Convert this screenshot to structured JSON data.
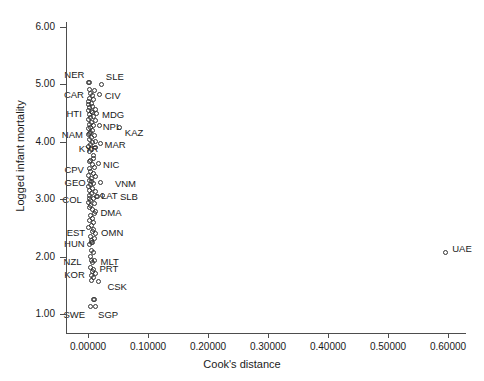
{
  "chart_data": {
    "type": "scatter",
    "title": "",
    "xlabel": "Cook's distance",
    "ylabel": "Logged infant mortality",
    "xlim": [
      -0.02,
      0.63
    ],
    "ylim": [
      0.75,
      6.3
    ],
    "xticks": [
      "0.00000",
      "0.10000",
      "0.20000",
      "0.30000",
      "0.40000",
      "0.50000",
      "0.60000"
    ],
    "xtick_values": [
      0.0,
      0.1,
      0.2,
      0.3,
      0.4,
      0.5,
      0.6
    ],
    "yticks": [
      "1.00",
      "2.00",
      "3.00",
      "4.00",
      "5.00",
      "6.00"
    ],
    "ytick_values": [
      1,
      2,
      3,
      4,
      5,
      6
    ],
    "grid": false,
    "legend": "none",
    "marker": "open-circle",
    "points": [
      {
        "label": "NER",
        "x": 0.0038,
        "y": 5.03,
        "lx": -26,
        "ly": -11
      },
      {
        "label": "SLE",
        "x": 0.023,
        "y": 4.995,
        "lx": 4,
        "ly": -11
      },
      {
        "label": "CAR",
        "x": 0.0048,
        "y": 4.835,
        "lx": -27,
        "ly": -2
      },
      {
        "label": "CIV",
        "x": 0.0195,
        "y": 4.82,
        "lx": 5,
        "ly": -2
      },
      {
        "label": "HTI",
        "x": 0.0075,
        "y": 4.5,
        "lx": -26,
        "ly": -2
      },
      {
        "label": "MDG",
        "x": 0.015,
        "y": 4.49,
        "lx": 5,
        "ly": -2
      },
      {
        "label": "NPL",
        "x": 0.0195,
        "y": 4.28,
        "lx": 3,
        "ly": -2
      },
      {
        "label": "KAZ",
        "x": 0.053,
        "y": 4.235,
        "lx": 5,
        "ly": 2
      },
      {
        "label": "NAM",
        "x": 0.003,
        "y": 4.13,
        "lx": -28,
        "ly": -2
      },
      {
        "label": "MAR",
        "x": 0.021,
        "y": 3.965,
        "lx": 4,
        "ly": -2
      },
      {
        "label": "KYR",
        "x": 0.0095,
        "y": 3.76,
        "lx": -15,
        "ly": -10
      },
      {
        "label": "NIC",
        "x": 0.0185,
        "y": 3.62,
        "lx": 4,
        "ly": -2
      },
      {
        "label": "CPV",
        "x": 0.004,
        "y": 3.53,
        "lx": -26,
        "ly": -2
      },
      {
        "label": "GEO",
        "x": 0.006,
        "y": 3.3,
        "lx": -27,
        "ly": -2
      },
      {
        "label": "VNM",
        "x": 0.0215,
        "y": 3.28,
        "lx": 14,
        "ly": -2
      },
      {
        "label": "LAT",
        "x": 0.0165,
        "y": 3.04,
        "lx": 3,
        "ly": 0
      },
      {
        "label": "SLB",
        "x": 0.025,
        "y": 3.06,
        "lx": 17,
        "ly": -2
      },
      {
        "label": "COL",
        "x": 0.0038,
        "y": 3.01,
        "lx": -28,
        "ly": -2
      },
      {
        "label": "DMA",
        "x": 0.014,
        "y": 2.77,
        "lx": 4,
        "ly": -2
      },
      {
        "label": "EST",
        "x": 0.0078,
        "y": 2.43,
        "lx": -26,
        "ly": -2
      },
      {
        "label": "OMN",
        "x": 0.0135,
        "y": 2.39,
        "lx": 5,
        "ly": 0
      },
      {
        "label": "HUN",
        "x": 0.0068,
        "y": 2.245,
        "lx": -28,
        "ly": -2
      },
      {
        "label": "NZL",
        "x": 0.006,
        "y": 1.93,
        "lx": -28,
        "ly": -2
      },
      {
        "label": "MLT",
        "x": 0.011,
        "y": 1.93,
        "lx": 6,
        "ly": -2
      },
      {
        "label": "KOR",
        "x": 0.007,
        "y": 1.66,
        "lx": -28,
        "ly": 0
      },
      {
        "label": "PRT",
        "x": 0.0125,
        "y": 1.69,
        "lx": 4,
        "ly": -8
      },
      {
        "label": "CSK",
        "x": 0.019,
        "y": 1.56,
        "lx": 8,
        "ly": 2
      },
      {
        "label": "SWE",
        "x": 0.0042,
        "y": 1.12,
        "lx": -27,
        "ly": 5
      },
      {
        "label": "SGP",
        "x": 0.0135,
        "y": 1.12,
        "lx": 2,
        "ly": 5
      },
      {
        "label": "UAE",
        "x": 0.597,
        "y": 2.07,
        "lx": 6,
        "ly": -7
      }
    ],
    "unlabeled_points": [
      {
        "x": 0.001,
        "y": 5.02
      },
      {
        "x": 0.0028,
        "y": 4.9
      },
      {
        "x": 0.0115,
        "y": 4.88
      },
      {
        "x": 0.0085,
        "y": 4.79
      },
      {
        "x": 0.004,
        "y": 4.745
      },
      {
        "x": 0.0105,
        "y": 4.72
      },
      {
        "x": 0.0018,
        "y": 4.7
      },
      {
        "x": 0.006,
        "y": 4.665
      },
      {
        "x": 0.0022,
        "y": 4.64
      },
      {
        "x": 0.009,
        "y": 4.61
      },
      {
        "x": 0.0038,
        "y": 4.585
      },
      {
        "x": 0.0125,
        "y": 4.56
      },
      {
        "x": 0.0015,
        "y": 4.54
      },
      {
        "x": 0.0072,
        "y": 4.52
      },
      {
        "x": 0.003,
        "y": 4.47
      },
      {
        "x": 0.0098,
        "y": 4.44
      },
      {
        "x": 0.0045,
        "y": 4.41
      },
      {
        "x": 0.002,
        "y": 4.38
      },
      {
        "x": 0.0135,
        "y": 4.355
      },
      {
        "x": 0.0062,
        "y": 4.33
      },
      {
        "x": 0.0028,
        "y": 4.3
      },
      {
        "x": 0.0105,
        "y": 4.27
      },
      {
        "x": 0.0042,
        "y": 4.24
      },
      {
        "x": 0.0015,
        "y": 4.215
      },
      {
        "x": 0.0082,
        "y": 4.19
      },
      {
        "x": 0.005,
        "y": 4.16
      },
      {
        "x": 0.0022,
        "y": 4.12
      },
      {
        "x": 0.0118,
        "y": 4.095
      },
      {
        "x": 0.0065,
        "y": 4.06
      },
      {
        "x": 0.0032,
        "y": 4.03
      },
      {
        "x": 0.014,
        "y": 4.005
      },
      {
        "x": 0.0088,
        "y": 3.975
      },
      {
        "x": 0.0048,
        "y": 3.945
      },
      {
        "x": 0.0018,
        "y": 3.915
      },
      {
        "x": 0.0128,
        "y": 3.89
      },
      {
        "x": 0.007,
        "y": 3.86
      },
      {
        "x": 0.0035,
        "y": 3.83
      },
      {
        "x": 0.01,
        "y": 3.7
      },
      {
        "x": 0.0052,
        "y": 3.67
      },
      {
        "x": 0.0025,
        "y": 3.64
      },
      {
        "x": 0.0078,
        "y": 3.6
      },
      {
        "x": 0.0115,
        "y": 3.54
      },
      {
        "x": 0.0045,
        "y": 3.47
      },
      {
        "x": 0.0092,
        "y": 3.44
      },
      {
        "x": 0.002,
        "y": 3.41
      },
      {
        "x": 0.014,
        "y": 3.38
      },
      {
        "x": 0.006,
        "y": 3.35
      },
      {
        "x": 0.003,
        "y": 3.32
      },
      {
        "x": 0.0108,
        "y": 3.27
      },
      {
        "x": 0.0048,
        "y": 3.24
      },
      {
        "x": 0.0018,
        "y": 3.21
      },
      {
        "x": 0.0085,
        "y": 3.18
      },
      {
        "x": 0.0038,
        "y": 3.15
      },
      {
        "x": 0.0125,
        "y": 3.12
      },
      {
        "x": 0.0068,
        "y": 3.09
      },
      {
        "x": 0.0028,
        "y": 3.06
      },
      {
        "x": 0.015,
        "y": 3.04
      },
      {
        "x": 0.0095,
        "y": 3.0
      },
      {
        "x": 0.0042,
        "y": 2.97
      },
      {
        "x": 0.0015,
        "y": 2.94
      },
      {
        "x": 0.011,
        "y": 2.91
      },
      {
        "x": 0.0058,
        "y": 2.88
      },
      {
        "x": 0.0025,
        "y": 2.85
      },
      {
        "x": 0.008,
        "y": 2.81
      },
      {
        "x": 0.0118,
        "y": 2.74
      },
      {
        "x": 0.005,
        "y": 2.7
      },
      {
        "x": 0.009,
        "y": 2.66
      },
      {
        "x": 0.0032,
        "y": 2.62
      },
      {
        "x": 0.0105,
        "y": 2.58
      },
      {
        "x": 0.0062,
        "y": 2.54
      },
      {
        "x": 0.0022,
        "y": 2.5
      },
      {
        "x": 0.0098,
        "y": 2.47
      },
      {
        "x": 0.0042,
        "y": 2.34
      },
      {
        "x": 0.0115,
        "y": 2.3
      },
      {
        "x": 0.0072,
        "y": 2.27
      },
      {
        "x": 0.009,
        "y": 2.23
      },
      {
        "x": 0.0035,
        "y": 2.2
      },
      {
        "x": 0.006,
        "y": 2.1
      },
      {
        "x": 0.0105,
        "y": 2.06
      },
      {
        "x": 0.0048,
        "y": 1.99
      },
      {
        "x": 0.0085,
        "y": 1.88
      },
      {
        "x": 0.0055,
        "y": 1.8
      },
      {
        "x": 0.0098,
        "y": 1.77
      },
      {
        "x": 0.0078,
        "y": 1.73
      },
      {
        "x": 0.0108,
        "y": 1.62
      },
      {
        "x": 0.006,
        "y": 1.58
      },
      {
        "x": 0.0092,
        "y": 1.25
      },
      {
        "x": 0.012,
        "y": 1.24
      }
    ]
  }
}
